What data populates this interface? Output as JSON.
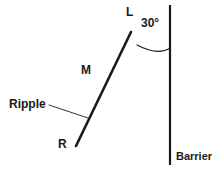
{
  "figure": {
    "background_color": "#ffffff",
    "stroke_color": "#1a1a1a",
    "width": 219,
    "height": 177
  },
  "labels": {
    "left_end": "L",
    "angle": "30°",
    "midpoint": "M",
    "ripple": "Ripple",
    "right_end": "R",
    "barrier": "Barrier"
  },
  "geometry": {
    "barrier": {
      "x": 170,
      "y_top": 5,
      "y_bottom": 165,
      "stroke_width": 2.2
    },
    "ripple_line": {
      "x1": 76,
      "y1": 146,
      "x2": 131,
      "y2": 32,
      "stroke_width": 2.6
    },
    "angle_arc": {
      "vertex_x": 131,
      "vertex_y": 32,
      "path": "M 137 45 Q 158 56 170 48",
      "stroke_width": 1.1,
      "degrees": 30
    },
    "leader_line": {
      "x1": 49,
      "y1": 105,
      "x2": 88,
      "y2": 118,
      "stroke_width": 0.9
    }
  }
}
